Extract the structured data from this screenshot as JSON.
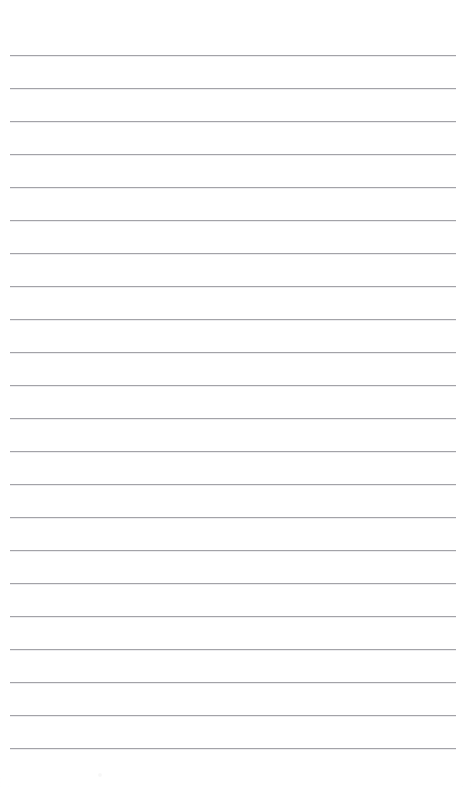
{
  "page": {
    "kind": "blank-ruled-notepad-page",
    "width": 471,
    "height": 787,
    "background_color": "#ffffff",
    "has_text": false,
    "has_handwriting": false,
    "content_text": ""
  },
  "ruling": {
    "style": "wide-ruled horizontal lines",
    "line_color": "#9c9ca1",
    "line_halo_color": "#d8d8dc",
    "line_thickness_px": 1,
    "line_count": 22,
    "line_spacing_px": 33,
    "line_left_px": 10,
    "line_right_px": 456,
    "line_width_px": 446,
    "first_line_y_px": 55,
    "last_line_y_px": 748,
    "top_margin_px": 55,
    "bottom_margin_px": 39,
    "left_margin_px": 10,
    "right_margin_px": 15,
    "has_vertical_margin_rule": false,
    "has_holes": false,
    "line_y_positions": [
      55,
      88,
      121,
      154,
      187,
      220,
      253,
      286,
      319,
      352,
      385,
      418,
      451,
      484,
      517,
      550,
      583,
      616,
      649,
      682,
      715,
      748
    ]
  },
  "artifacts": {
    "speck": {
      "x": 98,
      "y": 773,
      "size": 4,
      "color": "#f4f4f4"
    }
  }
}
